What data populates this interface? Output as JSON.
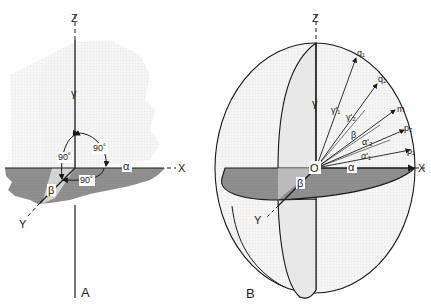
{
  "figure": {
    "panel_a": {
      "label": "A",
      "axes": {
        "z": "Z",
        "x": "X",
        "y": "Y"
      },
      "angle_labels": {
        "alpha": "α",
        "beta": "β",
        "gamma": "γ"
      },
      "right_angles": [
        "90˚",
        "90˚",
        "90˚"
      ]
    },
    "panel_b": {
      "label": "B",
      "axes": {
        "z": "Z",
        "x": "X",
        "y": "Y"
      },
      "origin": "O",
      "angle_labels": {
        "alpha": "α",
        "beta_horizontal": "β",
        "gamma": "γ"
      },
      "vectors": {
        "q1": "q₁",
        "q2": "q₂",
        "m": "m",
        "p2": "p₂",
        "p1": "p₁"
      },
      "vector_angles": {
        "gamma1": "γ'₁",
        "gamma2": "γ'₂",
        "beta": "β",
        "alpha2": "α'₂",
        "alpha1": "α'₁"
      }
    },
    "colors": {
      "line": "#1a1a1a",
      "shade_dark": "#8c8c8c",
      "shade_light": "#e6e6e6",
      "stipple": "#f2f2f2"
    }
  }
}
